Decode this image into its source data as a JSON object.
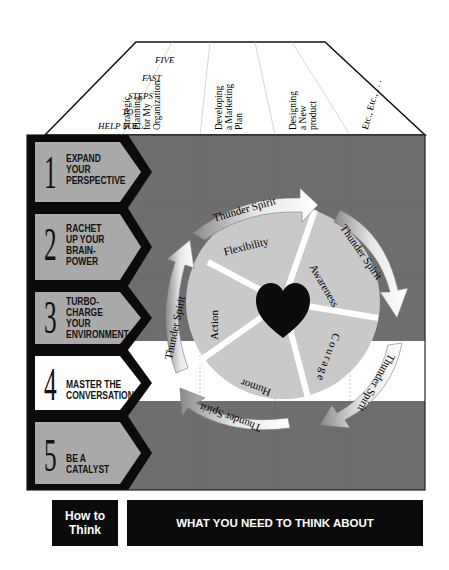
{
  "header": {
    "intro_lines": [
      "FIVE",
      "FAST",
      "STEPS",
      "TO",
      "HELP YOU…"
    ],
    "columns": [
      {
        "lines": [
          "Strategic",
          "Planning",
          "for My",
          "Organization"
        ]
      },
      {
        "lines": [
          "Developing",
          "a Marketing",
          "Plan"
        ]
      },
      {
        "lines": [
          "Designing",
          "a New",
          "product"
        ]
      },
      {
        "lines": [
          "Etc., Etc., . . ."
        ]
      }
    ]
  },
  "steps": [
    {
      "number": "1",
      "label_lines": [
        "EXPAND",
        "YOUR",
        "PERSPECTIVE"
      ]
    },
    {
      "number": "2",
      "label_lines": [
        "RACHET",
        "UP YOUR",
        "BRAIN-",
        "POWER"
      ]
    },
    {
      "number": "3",
      "label_lines": [
        "TURBO-",
        "CHARGE",
        "YOUR",
        "ENVIRONMENT"
      ]
    },
    {
      "number": "4",
      "label_lines": [
        "MASTER THE",
        "CONVERSATION"
      ]
    },
    {
      "number": "5",
      "label_lines": [
        "BE A",
        "CATALYST"
      ]
    }
  ],
  "wheel": {
    "segments": [
      "Flexibility",
      "Awareness",
      "Courage",
      "Humor",
      "Action"
    ],
    "center_icon": "heart-icon",
    "arrow_label": "Thunder Spirit",
    "arrow_count": 5
  },
  "footer": {
    "left_line1": "How to",
    "left_line2": "Think",
    "right": "WHAT YOU NEED TO THINK ABOUT"
  },
  "colors": {
    "dark_band": "#6e6e6e",
    "light_band": "#ffffff",
    "arrow_fill": "#a9a9a9",
    "black": "#0b0b0b",
    "wheel_fill": "#c9c9c9",
    "heart": "#0b0b0b"
  }
}
